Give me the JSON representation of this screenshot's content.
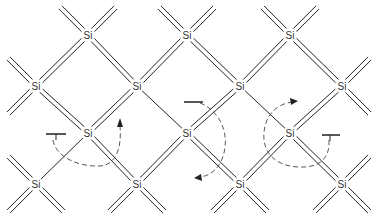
{
  "diagram": {
    "atom_symbol": "Si",
    "atoms": [
      {
        "id": "a1",
        "x": 88,
        "y": 35,
        "label": "Si"
      },
      {
        "id": "a2",
        "x": 187,
        "y": 35,
        "label": "Si"
      },
      {
        "id": "a3",
        "x": 290,
        "y": 35,
        "label": "Si"
      },
      {
        "id": "b1",
        "x": 36,
        "y": 86,
        "label": "Si"
      },
      {
        "id": "b2",
        "x": 137,
        "y": 86,
        "label": "Si"
      },
      {
        "id": "b3",
        "x": 240,
        "y": 86,
        "label": "Si"
      },
      {
        "id": "b4",
        "x": 342,
        "y": 86,
        "label": "Si"
      },
      {
        "id": "c1",
        "x": 88,
        "y": 133,
        "label": "Si"
      },
      {
        "id": "c2",
        "x": 187,
        "y": 133,
        "label": "Si"
      },
      {
        "id": "c3",
        "x": 290,
        "y": 133,
        "label": "Si"
      },
      {
        "id": "d1",
        "x": 36,
        "y": 184,
        "label": "Si"
      },
      {
        "id": "d2",
        "x": 137,
        "y": 184,
        "label": "Si"
      },
      {
        "id": "d3",
        "x": 240,
        "y": 184,
        "label": "Si"
      },
      {
        "id": "d4",
        "x": 342,
        "y": 184,
        "label": "Si"
      }
    ],
    "bonds": [
      {
        "from": "a1",
        "to": "b1",
        "type": "double"
      },
      {
        "from": "a1",
        "to": "b2",
        "type": "double"
      },
      {
        "from": "a2",
        "to": "b2",
        "type": "double"
      },
      {
        "from": "a2",
        "to": "b3",
        "type": "double"
      },
      {
        "from": "a3",
        "to": "b3",
        "type": "double"
      },
      {
        "from": "a3",
        "to": "b4",
        "type": "double"
      },
      {
        "from": "b1",
        "to": "c1",
        "type": "double"
      },
      {
        "from": "b2",
        "to": "c1",
        "type": "double"
      },
      {
        "from": "b2",
        "to": "c2",
        "type": "single"
      },
      {
        "from": "b3",
        "to": "c2",
        "type": "double"
      },
      {
        "from": "b3",
        "to": "c3",
        "type": "single"
      },
      {
        "from": "b4",
        "to": "c3",
        "type": "double"
      },
      {
        "from": "c1",
        "to": "d1",
        "type": "single"
      },
      {
        "from": "c1",
        "to": "d2",
        "type": "double"
      },
      {
        "from": "c2",
        "to": "d2",
        "type": "double"
      },
      {
        "from": "c2",
        "to": "d3",
        "type": "double"
      },
      {
        "from": "c3",
        "to": "d3",
        "type": "double"
      },
      {
        "from": "c3",
        "to": "d4",
        "type": "double"
      }
    ],
    "dangling_stubs": [
      {
        "atom": "a1",
        "dirs": [
          "nw",
          "ne"
        ]
      },
      {
        "atom": "a2",
        "dirs": [
          "nw",
          "ne"
        ]
      },
      {
        "atom": "a3",
        "dirs": [
          "nw",
          "ne"
        ]
      },
      {
        "atom": "b1",
        "dirs": [
          "nw",
          "sw"
        ]
      },
      {
        "atom": "b4",
        "dirs": [
          "ne",
          "se"
        ]
      },
      {
        "atom": "d1",
        "dirs": [
          "nw",
          "sw",
          "se"
        ]
      },
      {
        "atom": "d2",
        "dirs": [
          "sw",
          "se"
        ]
      },
      {
        "atom": "d3",
        "dirs": [
          "sw",
          "se"
        ]
      },
      {
        "atom": "d4",
        "dirs": [
          "ne",
          "sw",
          "se"
        ]
      }
    ],
    "broken_bond_markers": [
      {
        "name": "tbar-left",
        "x1": 46,
        "x2": 66,
        "y": 134,
        "stem_to_y": 140
      },
      {
        "name": "tbar-middle",
        "x1": 184,
        "x2": 203,
        "y": 102
      },
      {
        "name": "tbar-right",
        "x1": 322,
        "x2": 340,
        "y": 135,
        "stem_to_y": 141
      }
    ],
    "arrows": [
      {
        "name": "hop-arrow-left",
        "description": "dashed curved arrow from left broken bond under Si(88,133) up toward right",
        "head": [
          120,
          120
        ]
      },
      {
        "name": "hop-arrow-middle",
        "description": "dashed curved arrow from middle broken bond around Si(187,133) pointing down-left",
        "head": [
          195,
          178
        ]
      },
      {
        "name": "hop-arrow-right",
        "description": "dashed circular arrow around Si(290,133) pointing up-right",
        "head": [
          295,
          101
        ]
      }
    ],
    "colors": {
      "background": "#ffffff",
      "bond": "#222222",
      "label": "#333333",
      "arrow": "#444444"
    }
  }
}
